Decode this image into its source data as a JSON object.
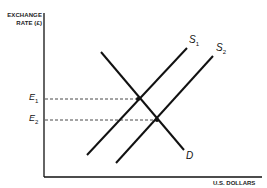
{
  "diagram": {
    "type": "supply-demand",
    "y_axis_label_line1": "EXCHANGE",
    "y_axis_label_line2": "RATE (£)",
    "x_axis_label": "U.S. DOLLARS",
    "ticks": {
      "e1": {
        "letter": "E",
        "sub": "1"
      },
      "e2": {
        "letter": "E",
        "sub": "2"
      }
    },
    "curves": {
      "s1": {
        "letter": "S",
        "sub": "1"
      },
      "s2": {
        "letter": "S",
        "sub": "2"
      },
      "d": {
        "letter": "D"
      }
    },
    "line_color": "#111111"
  }
}
